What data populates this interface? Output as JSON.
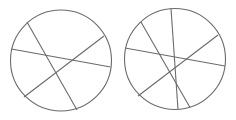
{
  "canvas": {
    "width": 236,
    "height": 120,
    "background": "#ffffff"
  },
  "style": {
    "stroke": "#6b6b6b",
    "stroke_width": 1.1
  },
  "figures": [
    {
      "name": "circle-three-cuts",
      "circle": {
        "cx": 61,
        "cy": 60.5,
        "r": 50.5
      },
      "chords": [
        {
          "x1": 27,
          "y1": 22,
          "x2": 77,
          "y2": 110
        },
        {
          "x1": 11.5,
          "y1": 49,
          "x2": 110.5,
          "y2": 67
        },
        {
          "x1": 24,
          "y1": 97,
          "x2": 104,
          "y2": 36
        }
      ]
    },
    {
      "name": "circle-four-cuts",
      "circle": {
        "cx": 175,
        "cy": 59,
        "r": 50.5
      },
      "chords": [
        {
          "x1": 171,
          "y1": 8.5,
          "x2": 178,
          "y2": 109.5
        },
        {
          "x1": 141,
          "y1": 22,
          "x2": 190,
          "y2": 107.5
        },
        {
          "x1": 125,
          "y1": 48,
          "x2": 225,
          "y2": 66
        },
        {
          "x1": 138,
          "y1": 96,
          "x2": 218,
          "y2": 35
        }
      ]
    }
  ]
}
